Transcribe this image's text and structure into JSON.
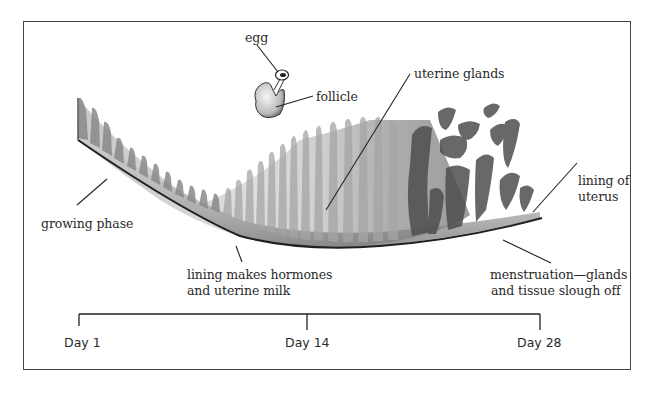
{
  "diagram": {
    "labels": {
      "egg": "egg",
      "follicle": "follicle",
      "uterine_glands": "uterine glands",
      "lining_of_uterus_line1": "lining of",
      "lining_of_uterus_line2": "uterus",
      "growing_phase": "growing phase",
      "lining_hormones_line1": "lining makes hormones",
      "lining_hormones_line2": "and uterine milk",
      "menstruation_line1": "menstruation—glands",
      "menstruation_line2": "and tissue slough off"
    },
    "timeline": {
      "ticks": [
        {
          "label": "Day 1"
        },
        {
          "label": "Day 14"
        },
        {
          "label": "Day 28"
        }
      ]
    },
    "colors": {
      "line": "#222222",
      "border": "#444444",
      "light_tissue": "#b8b8b8",
      "dark_tissue": "#555555"
    }
  }
}
